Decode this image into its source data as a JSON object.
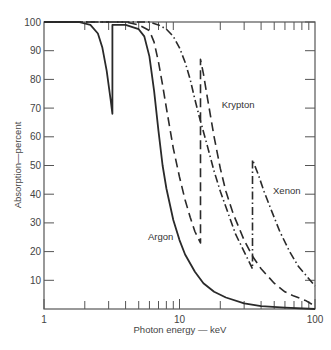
{
  "chart_data": {
    "type": "line",
    "title": "",
    "xlabel": "Photon energy — keV",
    "ylabel": "Absorption—percent",
    "xscale": "log",
    "xlim": [
      1,
      100
    ],
    "ylim": [
      0,
      100
    ],
    "x_ticks": [
      {
        "value": 1,
        "label": "1"
      },
      {
        "value": 10,
        "label": "10"
      },
      {
        "value": 100,
        "label": "100"
      }
    ],
    "y_ticks": [
      {
        "value": 10,
        "label": "10"
      },
      {
        "value": 20,
        "label": "20"
      },
      {
        "value": 30,
        "label": "30"
      },
      {
        "value": 40,
        "label": "40"
      },
      {
        "value": 50,
        "label": "50"
      },
      {
        "value": 60,
        "label": "60"
      },
      {
        "value": 70,
        "label": "70"
      },
      {
        "value": 80,
        "label": "80"
      },
      {
        "value": 90,
        "label": "90"
      },
      {
        "value": 100,
        "label": "100"
      }
    ],
    "grid": false,
    "legend": "inline labels",
    "series": [
      {
        "name": "Argon",
        "style": "solid",
        "label_pos": {
          "x": 9.0,
          "y": 24
        },
        "points": [
          [
            1.0,
            100
          ],
          [
            1.8,
            100
          ],
          [
            2.2,
            99
          ],
          [
            2.5,
            96
          ],
          [
            2.7,
            91
          ],
          [
            2.9,
            83
          ],
          [
            3.1,
            73
          ],
          [
            3.2,
            68
          ],
          [
            3.2,
            99
          ],
          [
            4.0,
            99
          ],
          [
            5.0,
            97.5
          ],
          [
            5.5,
            95
          ],
          [
            6.0,
            88
          ],
          [
            6.5,
            76
          ],
          [
            7.0,
            62
          ],
          [
            7.5,
            50
          ],
          [
            8.0,
            42
          ],
          [
            9.0,
            31
          ],
          [
            10.0,
            24
          ],
          [
            11.0,
            19
          ],
          [
            13.0,
            13
          ],
          [
            15.0,
            9
          ],
          [
            18.0,
            6
          ],
          [
            22.0,
            4
          ],
          [
            30.0,
            2
          ],
          [
            40.0,
            1
          ],
          [
            60.0,
            0.5
          ],
          [
            100.0,
            0
          ]
        ]
      },
      {
        "name": "Krypton",
        "style": "dashed",
        "label_pos": {
          "x": 20.5,
          "y": 70
        },
        "points": [
          [
            1.0,
            100
          ],
          [
            4.0,
            100
          ],
          [
            5.0,
            99
          ],
          [
            6.0,
            97
          ],
          [
            6.5,
            93
          ],
          [
            7.0,
            86
          ],
          [
            7.5,
            78
          ],
          [
            8.0,
            70
          ],
          [
            9.0,
            56
          ],
          [
            10.0,
            46
          ],
          [
            11.0,
            38
          ],
          [
            12.0,
            32
          ],
          [
            13.0,
            27
          ],
          [
            14.3,
            23
          ],
          [
            14.3,
            87
          ],
          [
            15.0,
            82
          ],
          [
            16.0,
            74
          ],
          [
            18.0,
            60
          ],
          [
            20.0,
            49
          ],
          [
            22.0,
            41
          ],
          [
            25.0,
            33
          ],
          [
            30.0,
            24
          ],
          [
            35.0,
            18
          ],
          [
            40.0,
            14
          ],
          [
            50.0,
            9
          ],
          [
            60.0,
            6
          ],
          [
            70.0,
            4.5
          ],
          [
            85.0,
            3
          ],
          [
            100.0,
            1
          ]
        ]
      },
      {
        "name": "Xenon",
        "style": "dash-dot",
        "label_pos": {
          "x": 49,
          "y": 40
        },
        "points": [
          [
            1.0,
            100
          ],
          [
            6.0,
            100
          ],
          [
            7.0,
            99
          ],
          [
            8.0,
            97.5
          ],
          [
            9.0,
            95
          ],
          [
            10.0,
            91
          ],
          [
            11.0,
            86
          ],
          [
            12.0,
            80
          ],
          [
            13.0,
            73
          ],
          [
            14.0,
            67
          ],
          [
            16.0,
            57
          ],
          [
            18.0,
            48
          ],
          [
            20.0,
            41
          ],
          [
            23.0,
            33
          ],
          [
            26.0,
            26
          ],
          [
            30.0,
            20
          ],
          [
            34.6,
            14
          ],
          [
            34.6,
            52
          ],
          [
            38.0,
            47
          ],
          [
            42.0,
            41
          ],
          [
            48.0,
            34
          ],
          [
            55.0,
            27
          ],
          [
            65.0,
            20
          ],
          [
            75.0,
            15
          ],
          [
            85.0,
            12
          ],
          [
            100.0,
            8
          ]
        ]
      }
    ]
  }
}
